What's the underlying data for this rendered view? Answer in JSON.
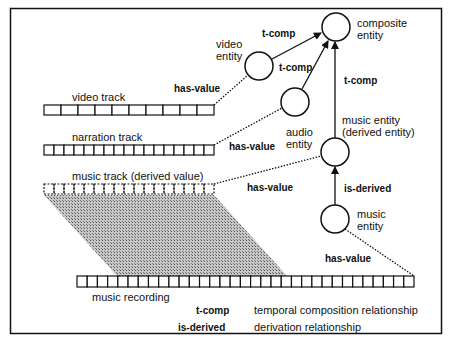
{
  "tracks": {
    "video": {
      "label": "video track",
      "cells": 10
    },
    "narration": {
      "label": "narration track",
      "cells": 17
    },
    "music": {
      "label": "music track (derived value)",
      "cells": 17
    },
    "recording": {
      "label": "music recording",
      "cells": 33
    }
  },
  "entities": {
    "composite": {
      "line1": "composite",
      "line2": "entity"
    },
    "video": {
      "line1": "video",
      "line2": "entity"
    },
    "audio": {
      "line1": "audio",
      "line2": "entity"
    },
    "music_derived": {
      "line1": "music entity",
      "line2": "(derived entity)"
    },
    "music": {
      "line1": "music",
      "line2": "entity"
    }
  },
  "relations": {
    "t_comp_video": "t-comp",
    "t_comp_audio": "t-comp",
    "t_comp_music": "t-comp",
    "is_derived": "is-derived",
    "has_value_video": "has-value",
    "has_value_narration": "has-value",
    "has_value_music_track": "has-value",
    "has_value_recording": "has-value"
  },
  "legend": [
    {
      "term": "t-comp",
      "desc": "temporal composition relationship"
    },
    {
      "term": "is-derived",
      "desc": "derivation relationship"
    }
  ]
}
